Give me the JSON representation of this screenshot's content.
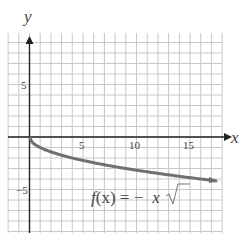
{
  "chart_data": {
    "type": "line",
    "title": "",
    "function_label": "f(x) = −√x",
    "xlabel": "x",
    "ylabel": "y",
    "xlim": [
      -2,
      18
    ],
    "ylim": [
      -9,
      10
    ],
    "x_ticks": [
      5,
      10,
      15
    ],
    "y_ticks": [
      5,
      -5
    ],
    "x_tick_labels": [
      "5",
      "10",
      "15"
    ],
    "y_tick_labels": [
      "5",
      "−5"
    ],
    "grid": true,
    "series": [
      {
        "name": "f(x) = −√x",
        "x": [
          0,
          0.25,
          1,
          2,
          4,
          6,
          9,
          12,
          16,
          17.5
        ],
        "y": [
          0,
          -0.5,
          -1,
          -1.41,
          -2,
          -2.45,
          -3,
          -3.46,
          -4,
          -4.18
        ],
        "color": "#707070",
        "arrow_end": true
      }
    ]
  },
  "labels": {
    "x_axis": "x",
    "y_axis": "y",
    "tick_x_5": "5",
    "tick_x_10": "10",
    "tick_x_15": "15",
    "tick_y_5": "5",
    "tick_y_neg5": "−5",
    "func_f": "f",
    "func_rest": "(x) = −",
    "func_x": "x"
  },
  "colors": {
    "grid": "#c8c8c8",
    "axis": "#222222",
    "curve": "#707070",
    "text": "#444444"
  }
}
